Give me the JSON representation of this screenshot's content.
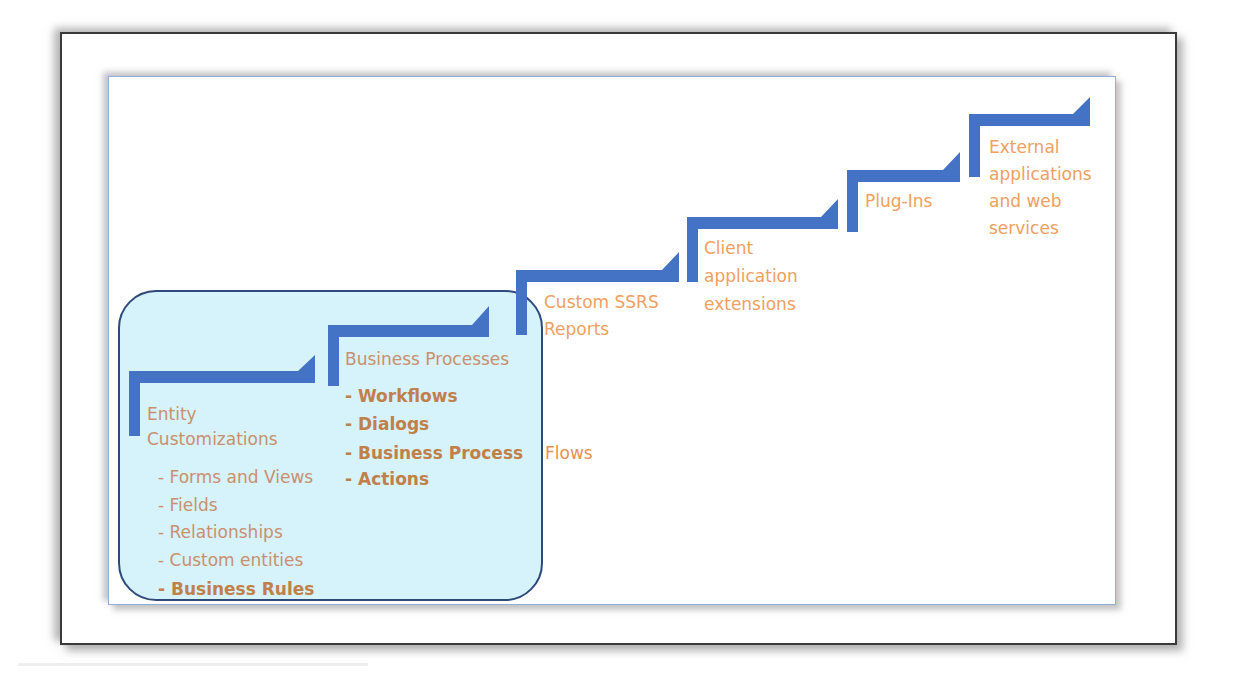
{
  "diagram": {
    "type": "staircase",
    "colors": {
      "step": "#4472C4",
      "label": "#F0A060",
      "label_in_box": "#C89070",
      "highlight_fill": "#C8EEF8",
      "highlight_border": "#2E4A7A",
      "frame": "#3A3A3A",
      "slide_border": "#8FB0DC"
    },
    "steps": [
      {
        "title_lines": [
          "Entity",
          "Customizations"
        ],
        "items": [
          "- Forms and Views",
          "- Fields",
          "- Relationships",
          "- Custom entities"
        ],
        "bold_items": [
          "- Business Rules"
        ]
      },
      {
        "title_lines": [
          "Business Processes"
        ],
        "items": [],
        "bold_items": [
          "- Workflows",
          "- Dialogs",
          "- Business Process",
          "- Actions"
        ],
        "overflow_text": "Flows"
      },
      {
        "title_lines": [
          "Custom SSRS",
          "Reports"
        ]
      },
      {
        "title_lines": [
          "Client",
          "application",
          "extensions"
        ]
      },
      {
        "title_lines": [
          "Plug-Ins"
        ]
      },
      {
        "title_lines": [
          "External",
          "applications",
          "and web",
          "services"
        ]
      }
    ],
    "highlight": {
      "covers_steps": [
        1,
        2
      ]
    }
  }
}
